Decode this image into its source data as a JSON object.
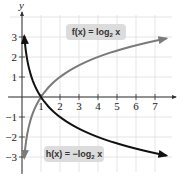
{
  "chart_data": {
    "type": "line",
    "title": "",
    "xlabel": "x",
    "ylabel": "y",
    "xlim": [
      -0.6,
      7.9
    ],
    "ylim": [
      -3.7,
      4.1
    ],
    "grid": true,
    "x_ticks": [
      1,
      2,
      3,
      4,
      5,
      6,
      7
    ],
    "x_tick_labels": [
      "1",
      "2",
      "3",
      "4",
      "5",
      "6",
      "7"
    ],
    "y_ticks": [
      3,
      2,
      1,
      -1,
      -2,
      -3
    ],
    "y_tick_labels": [
      "3",
      "2",
      "1",
      "−1",
      "−2",
      "−3"
    ],
    "series": [
      {
        "name": "f(x) = log₂ x",
        "label_main": "f(x) = log",
        "label_sub": "2",
        "label_tail": " x",
        "color": "#7a7a7a",
        "x": [
          0.125,
          0.25,
          0.5,
          1,
          2,
          4,
          7.6
        ],
        "values": [
          -3,
          -2,
          -1,
          0,
          1,
          2,
          2.93
        ]
      },
      {
        "name": "h(x) = −log₂ x",
        "label_main": "h(x) = −log",
        "label_sub": "2",
        "label_tail": " x",
        "color": "#111111",
        "x": [
          0.125,
          0.25,
          0.5,
          1,
          2,
          4,
          7.6
        ],
        "values": [
          3,
          2,
          1,
          0,
          -1,
          -2,
          -2.93
        ]
      }
    ],
    "annotations": [
      {
        "text": "f(x) = log₂ x",
        "near_x": 4.3,
        "near_y": 2.6
      },
      {
        "text": "h(x) = −log₂ x",
        "near_x": 2.3,
        "near_y": -2.7
      }
    ]
  }
}
